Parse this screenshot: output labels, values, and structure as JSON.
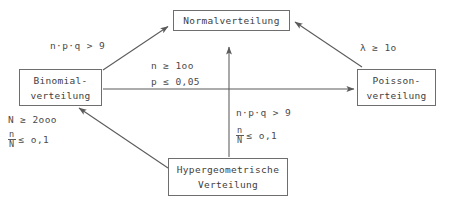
{
  "diagram": {
    "type": "flow-diagram",
    "background_color": "#ffffff",
    "line_color": "#6e6e6e",
    "text_color": "#3d3d3d"
  },
  "nodes": {
    "normal": {
      "line1": "Normalverteilung"
    },
    "binomial": {
      "line1": "Binomial-",
      "line2": "verteilung"
    },
    "poisson": {
      "line1": "Poisson-",
      "line2": "verteilung"
    },
    "hypergeometric": {
      "line1": "Hypergeometrische",
      "line2": "Verteilung"
    }
  },
  "edge_labels": {
    "binomial_to_normal": "n·p·q > 9",
    "poisson_to_normal": "λ ≥ 1o",
    "binomial_to_poisson_1": "n ≥ 1oo",
    "binomial_to_poisson_2": "p ≤ 0,05",
    "hyper_to_normal_1": "n·p·q > 9",
    "hyper_to_normal_2_num": "n",
    "hyper_to_normal_2_den": "N",
    "hyper_to_normal_2_rel": "≤ o,1",
    "hyper_to_binomial_1": "N ≥ 2ooo",
    "hyper_to_binomial_2_num": "n",
    "hyper_to_binomial_2_den": "N",
    "hyper_to_binomial_2_rel": "≤ o,1"
  },
  "edges": [
    {
      "name": "binomial-to-normal",
      "from": "binomial",
      "to": "normal",
      "direction": "up-right"
    },
    {
      "name": "poisson-to-normal",
      "from": "poisson",
      "to": "normal",
      "direction": "up-left"
    },
    {
      "name": "binomial-to-poisson",
      "from": "binomial",
      "to": "poisson",
      "direction": "right"
    },
    {
      "name": "hypergeometric-to-normal",
      "from": "hypergeometric",
      "to": "normal",
      "direction": "up"
    },
    {
      "name": "hypergeometric-to-binomial",
      "from": "hypergeometric",
      "to": "binomial",
      "direction": "up-left"
    }
  ]
}
